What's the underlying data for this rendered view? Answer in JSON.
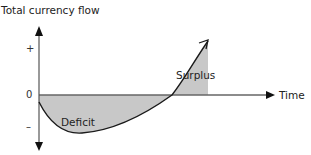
{
  "diagram": {
    "title": "Total currency flow",
    "y_axis": {
      "label": "Total currency flow",
      "ticks": {
        "plus": "+",
        "zero": "0",
        "minus": "–"
      }
    },
    "x_axis": {
      "label": "Time"
    },
    "regions": {
      "deficit": "Deficit",
      "surplus": "Surplus"
    },
    "colors": {
      "fill": "#c8c8c8",
      "line": "#1a1a1a",
      "axis": "#555555"
    }
  }
}
